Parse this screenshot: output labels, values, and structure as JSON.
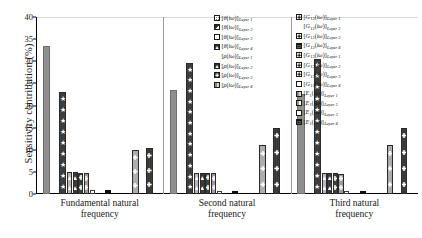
{
  "chart_data": {
    "type": "bar",
    "title": "",
    "xlabel": "",
    "ylabel": "Sensitivity contribution (%)",
    "ylim": [
      0,
      40
    ],
    "ytick_labels": [
      "0",
      "5",
      "10",
      "15",
      "20",
      "25",
      "30",
      "35",
      "40"
    ],
    "ytick_values": [
      0,
      5,
      10,
      15,
      20,
      25,
      30,
      35,
      40
    ],
    "grid": false,
    "legend_position": "top-right (two blocks)",
    "categories": [
      "Fundamental natural frequency",
      "Second natural frequency",
      "Third natural frequency"
    ],
    "series": [
      {
        "name": "[theta(iw)]_Layer 1",
        "values": [
          33.5,
          23.5,
          22.5
        ]
      },
      {
        "name": "[theta(iw)]_Layer 2",
        "values": [
          23.0,
          29.5,
          30.5
        ]
      },
      {
        "name": "[theta(iw)]_Layer 3",
        "values": [
          0.0,
          0.0,
          0.0
        ]
      },
      {
        "name": "[theta(iw)]_Layer 4",
        "values": [
          4.9,
          4.8,
          4.8
        ]
      },
      {
        "name": "[rho(iw)]_Layer 1",
        "values": [
          0.3,
          0.3,
          0.3
        ]
      },
      {
        "name": "[rho(iw)]_Layer 2",
        "values": [
          4.8,
          4.8,
          4.7
        ]
      },
      {
        "name": "[rho(iw)]_Layer 3",
        "values": [
          4.6,
          4.7,
          4.6
        ]
      },
      {
        "name": "[rho(iw)]_Layer 4",
        "values": [
          4.6,
          4.6,
          4.6
        ]
      },
      {
        "name": "[G12(iw)]_Layer 1",
        "values": [
          0.6,
          0.4,
          0.5
        ]
      },
      {
        "name": "[G12(iw)]_Layer 2",
        "values": [
          0.0,
          0.0,
          0.0
        ]
      },
      {
        "name": "[G12(iw)]_Layer 3",
        "values": [
          0.0,
          0.0,
          0.0
        ]
      },
      {
        "name": "[G12(iw)]_Layer 4",
        "values": [
          1.0,
          0.6,
          0.7
        ]
      },
      {
        "name": "[G13(iw)]_Layer 1",
        "values": [
          0.0,
          0.0,
          0.0
        ]
      },
      {
        "name": "[G13(iw)]_Layer 2",
        "values": [
          0.0,
          0.0,
          0.0
        ]
      },
      {
        "name": "[G13(iw)]_Layer 3",
        "values": [
          0.0,
          0.0,
          0.0
        ]
      },
      {
        "name": "[G13(iw)]_Layer 4",
        "values": [
          0.0,
          0.0,
          0.0
        ]
      },
      {
        "name": "[E1(iw)]_Layer 1",
        "values": [
          10.0,
          11.0,
          11.0
        ]
      },
      {
        "name": "[E1(iw)]_Layer 2",
        "values": [
          0.0,
          0.0,
          0.0
        ]
      },
      {
        "name": "[E1(iw)]_Layer 3",
        "values": [
          0.0,
          0.0,
          0.0
        ]
      },
      {
        "name": "[E1(iw)]_Layer 4",
        "values": [
          10.5,
          15.0,
          15.0
        ]
      }
    ]
  },
  "axis": {
    "ylabel": "Sensitivity contribution (%)",
    "ticks": [
      "40",
      "35",
      "30",
      "25",
      "20",
      "15",
      "10",
      "5",
      "0"
    ]
  },
  "groups": [
    {
      "line1": "Fundamental natural",
      "line2": "frequency"
    },
    {
      "line1": "Second natural",
      "line2": "frequency"
    },
    {
      "line1": "Third natural",
      "line2": "frequency"
    }
  ],
  "bars": {
    "g1": [
      {
        "name": "theta-layer1",
        "value": 33.5,
        "style": "solid-gray"
      },
      {
        "name": "theta-layer2",
        "value": 23.0,
        "style": "dark-star"
      },
      {
        "name": "rho-layer1",
        "value": 4.9,
        "style": "light-plus"
      },
      {
        "name": "theta-layer4",
        "value": 4.9,
        "style": "dark-triangle"
      },
      {
        "name": "rho-layer2",
        "value": 4.8,
        "style": "dark-star-sm"
      },
      {
        "name": "rho-layer3",
        "value": 4.7,
        "style": "mid-star"
      },
      {
        "name": "rho-layer4",
        "value": 1.0,
        "style": "blank"
      },
      {
        "name": "g12-layer4",
        "value": 1.0,
        "style": "black"
      },
      {
        "name": "e1-layer1",
        "value": 10.0,
        "style": "light-plus-tall"
      },
      {
        "name": "e1-layer4",
        "value": 10.5,
        "style": "dark-plus-tall"
      }
    ],
    "g2": [
      {
        "name": "theta-layer1",
        "value": 23.5,
        "style": "solid-gray"
      },
      {
        "name": "theta-layer2",
        "value": 29.5,
        "style": "dark-star"
      },
      {
        "name": "rho-layer1",
        "value": 4.8,
        "style": "light-plus"
      },
      {
        "name": "theta-layer4",
        "value": 4.8,
        "style": "dark-triangle"
      },
      {
        "name": "rho-layer2",
        "value": 4.8,
        "style": "dark-star-sm"
      },
      {
        "name": "rho-layer3",
        "value": 4.7,
        "style": "mid-star"
      },
      {
        "name": "rho-layer4",
        "value": 0.6,
        "style": "blank"
      },
      {
        "name": "g12-layer4",
        "value": 0.6,
        "style": "black"
      },
      {
        "name": "e1-layer1",
        "value": 11.0,
        "style": "light-plus-tall"
      },
      {
        "name": "e1-layer4",
        "value": 15.0,
        "style": "dark-plus-tall"
      }
    ],
    "g3": [
      {
        "name": "theta-layer1",
        "value": 22.5,
        "style": "solid-gray"
      },
      {
        "name": "theta-layer2",
        "value": 30.5,
        "style": "dark-star"
      },
      {
        "name": "rho-layer1",
        "value": 4.8,
        "style": "light-plus"
      },
      {
        "name": "theta-layer4",
        "value": 4.8,
        "style": "dark-triangle"
      },
      {
        "name": "rho-layer2",
        "value": 4.7,
        "style": "dark-star-sm"
      },
      {
        "name": "rho-layer3",
        "value": 4.6,
        "style": "mid-star"
      },
      {
        "name": "rho-layer4",
        "value": 0.7,
        "style": "blank"
      },
      {
        "name": "g12-layer4",
        "value": 0.7,
        "style": "black"
      },
      {
        "name": "e1-layer1",
        "value": 11.0,
        "style": "light-plus-tall"
      },
      {
        "name": "e1-layer4",
        "value": 15.0,
        "style": "dark-plus-tall"
      }
    ]
  },
  "legend_1": [
    {
      "sym": "θ",
      "layer": "Layer 1",
      "style": "grid-gray",
      "glyph": ""
    },
    {
      "sym": "θ",
      "layer": "Layer 2",
      "style": "dark-corner",
      "glyph": "◢"
    },
    {
      "sym": "θ",
      "layer": "Layer 3",
      "style": "white",
      "glyph": ""
    },
    {
      "sym": "θ",
      "layer": "Layer 4",
      "style": "dark-triangle",
      "glyph": "▲"
    },
    {
      "sym": "ρ",
      "layer": "Layer 1",
      "style": "none",
      "glyph": ""
    },
    {
      "sym": "ρ",
      "layer": "Layer 2",
      "style": "dark-triangle",
      "glyph": "▲"
    },
    {
      "sym": "ρ",
      "layer": "Layer 3",
      "style": "dark-plus",
      "glyph": "✚"
    },
    {
      "sym": "ρ",
      "layer": "Layer 4",
      "style": "mid-stripe",
      "glyph": ""
    }
  ],
  "legend_2": [
    {
      "sym": "G",
      "sub": "12",
      "layer": "Layer 1",
      "style": "white-plus",
      "glyph": "✚"
    },
    {
      "sym": "G",
      "sub": "12",
      "layer": "Layer 2",
      "style": "none",
      "glyph": ""
    },
    {
      "sym": "G",
      "sub": "12",
      "layer": "Layer 3",
      "style": "white-plus",
      "glyph": "✚"
    },
    {
      "sym": "G",
      "sub": "12",
      "layer": "Layer 4",
      "style": "black-ring",
      "glyph": "□"
    },
    {
      "sym": "G",
      "sub": "13",
      "layer": "Layer 1",
      "style": "white-plus",
      "glyph": "✚"
    },
    {
      "sym": "G",
      "sub": "13",
      "layer": "Layer 2",
      "style": "white-plus",
      "glyph": "✚"
    },
    {
      "sym": "G",
      "sub": "13",
      "layer": "Layer 3",
      "style": "white-plus",
      "glyph": "✚"
    },
    {
      "sym": "G",
      "sub": "13",
      "layer": "Layer 4",
      "style": "white",
      "glyph": ""
    },
    {
      "sym": "E",
      "sub": "1",
      "layer": "Layer 1",
      "style": "mid-stripe",
      "glyph": ""
    },
    {
      "sym": "E",
      "sub": "1",
      "layer": "Layer 2",
      "style": "half-gray",
      "glyph": ""
    },
    {
      "sym": "E",
      "sub": "1",
      "layer": "Layer 3",
      "style": "white",
      "glyph": ""
    },
    {
      "sym": "E",
      "sub": "1",
      "layer": "Layer 4",
      "style": "black-ring",
      "glyph": "□"
    }
  ]
}
